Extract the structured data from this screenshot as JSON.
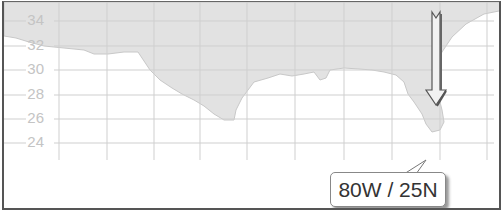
{
  "map": {
    "y_axis_labels": [
      "34",
      "32",
      "30",
      "28",
      "26",
      "24"
    ],
    "grid_color": "#d0d0d0",
    "land_color": "#e2e2e2",
    "water_color": "#ffffff"
  },
  "marker": {
    "type": "arrow-down",
    "color": "#f0f0f0"
  },
  "callout": {
    "label": "80W / 25N"
  }
}
